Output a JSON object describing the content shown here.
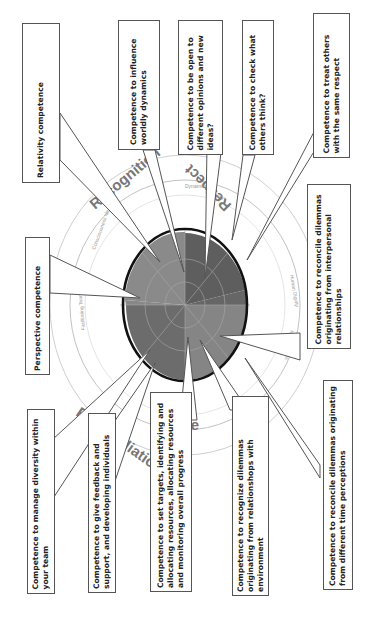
{
  "orientation": "rotated-90-ccw",
  "chart": {
    "type": "polar-area",
    "colors": {
      "dark": "#5f5f5f",
      "mid": "#7a7a7a",
      "light": "#8c8c8c",
      "ring": "#111111",
      "axis": "#bbbbbb"
    },
    "sector_labels": {
      "top_left": "Recognition",
      "top_right": "Respect",
      "bottom_left": "Reconciliation",
      "bottom_right": "Re..."
    },
    "ring_labels": [
      "Dynamics",
      "Curiosity",
      "Human Dignity",
      "Relationships",
      "Consciousness Ideas",
      "Facilitating Teams"
    ],
    "ticks": [
      "1",
      "2",
      "3",
      "4",
      "5",
      "6",
      "7"
    ]
  },
  "callouts": [
    {
      "id": "relativity",
      "text": "Relativity competence"
    },
    {
      "id": "influence",
      "text": "Competence to influence worldly dynamics"
    },
    {
      "id": "open",
      "text": "Competence to be open to different opinions and new ideas?"
    },
    {
      "id": "check",
      "text": "Competence to check what others think?"
    },
    {
      "id": "respect",
      "text": "Competence to treat others with the same respect"
    },
    {
      "id": "perspective",
      "text": "Perspective competence"
    },
    {
      "id": "interpersonal",
      "text": "Competence to reconcile dilemmas originating from interpersonal relationships"
    },
    {
      "id": "diversity",
      "text": "Competence to manage diversity within your team"
    },
    {
      "id": "feedback",
      "text": "Competence to give feedback and support, and developing individuals"
    },
    {
      "id": "targets",
      "text": "Competence to set targets, identifying and allocating resources, allocating resources and monitoring overall progress"
    },
    {
      "id": "environment",
      "text": "Competence to recognize dilemmas originating from relationshops with environment"
    },
    {
      "id": "time",
      "text": "Competence to reconcile dilemmas originating from different time perceptions"
    }
  ]
}
